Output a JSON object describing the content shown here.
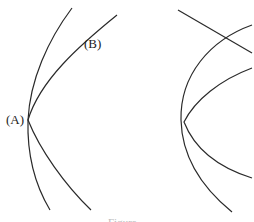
{
  "figure": {
    "left_panel": {
      "labels": [
        {
          "id": "A",
          "text": "(A)",
          "x": 6,
          "y": 124
        },
        {
          "id": "B",
          "text": "(B)",
          "x": 84,
          "y": 48
        }
      ],
      "curves": [
        {
          "name": "curve-1",
          "d": "M72,8 C48,40 30,80 28,120 C27,155 35,185 50,210"
        },
        {
          "name": "curve-2",
          "d": "M117,15 C80,45 40,80 28,120 C40,150 65,185 91,210"
        }
      ]
    },
    "right_panel": {
      "curves": [
        {
          "name": "straight-line",
          "d": "M178,10 L252,53"
        },
        {
          "name": "curve-3",
          "d": "M252,25 C210,40 180,75 181,120 C182,160 205,190 232,212"
        },
        {
          "name": "curve-4",
          "d": "M252,68 C220,80 195,100 184,122 C195,150 220,168 252,178"
        }
      ]
    },
    "caption": "Figure"
  }
}
